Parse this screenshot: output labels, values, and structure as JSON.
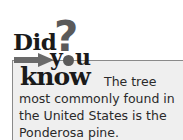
{
  "heading": {
    "did": "Did",
    "question_mark": "?",
    "you_y": "y",
    "you_u": "u",
    "know": "know"
  },
  "fact": {
    "line1": "The tree",
    "line2": "most commonly found in",
    "line3": "the United States is the",
    "line4": "Ponderosa pine."
  },
  "colors": {
    "box_background": "#efefef",
    "box_border": "#8a8a8a",
    "heading_text": "#1a1a1a",
    "accent_gray": "#5a5a5a",
    "body_text": "#2a2a2a"
  }
}
